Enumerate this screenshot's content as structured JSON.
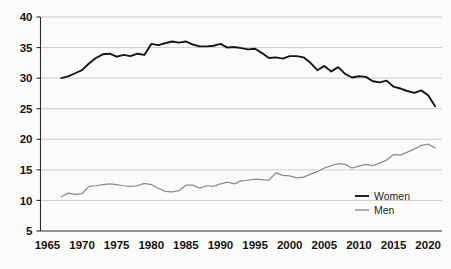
{
  "chart_data": {
    "type": "line",
    "title": "",
    "subtitle": "",
    "xlabel": "",
    "ylabel": "",
    "xlim": [
      1964,
      2022
    ],
    "ylim": [
      5,
      40
    ],
    "grid": true,
    "grid_axis": "y",
    "legend_position": "inside-bottom-right",
    "x_ticks": [
      1965,
      1970,
      1975,
      1980,
      1985,
      1990,
      1995,
      2000,
      2005,
      2010,
      2015,
      2020
    ],
    "y_ticks": [
      5,
      10,
      15,
      20,
      25,
      30,
      35,
      40
    ],
    "colors": {
      "women": "#151515",
      "men": "#8b8b8b",
      "gridline": "#b9b9b9",
      "axis": "#2b2b2b",
      "background": "#fbfbf9"
    },
    "x": [
      1967,
      1968,
      1969,
      1970,
      1971,
      1972,
      1973,
      1974,
      1975,
      1976,
      1977,
      1978,
      1979,
      1980,
      1981,
      1982,
      1983,
      1984,
      1985,
      1986,
      1987,
      1988,
      1989,
      1990,
      1991,
      1992,
      1993,
      1994,
      1995,
      1996,
      1997,
      1998,
      1999,
      2000,
      2001,
      2002,
      2003,
      2004,
      2005,
      2006,
      2007,
      2008,
      2009,
      2010,
      2011,
      2012,
      2013,
      2014,
      2015,
      2016,
      2017,
      2018,
      2019,
      2020,
      2021
    ],
    "series": [
      {
        "name": "Women",
        "color": "#151515",
        "values": [
          30.0,
          30.3,
          30.8,
          31.3,
          32.4,
          33.3,
          33.9,
          34.0,
          33.5,
          33.8,
          33.6,
          34.0,
          33.8,
          35.6,
          35.4,
          35.7,
          36.0,
          35.8,
          36.0,
          35.5,
          35.2,
          35.2,
          35.3,
          35.6,
          35.0,
          35.1,
          34.9,
          34.7,
          34.8,
          34.1,
          33.3,
          33.4,
          33.2,
          33.6,
          33.6,
          33.4,
          32.5,
          31.3,
          32.0,
          31.1,
          31.8,
          30.7,
          30.1,
          30.3,
          30.2,
          29.5,
          29.3,
          29.6,
          28.6,
          28.3,
          27.9,
          27.6,
          28.0,
          27.2,
          25.4
        ]
      },
      {
        "name": "Men",
        "color": "#8b8b8b",
        "values": [
          10.6,
          11.2,
          11.0,
          11.1,
          12.3,
          12.4,
          12.6,
          12.7,
          12.6,
          12.4,
          12.3,
          12.4,
          12.8,
          12.6,
          12.0,
          11.5,
          11.4,
          11.6,
          12.5,
          12.5,
          12.0,
          12.4,
          12.3,
          12.7,
          13.0,
          12.7,
          13.2,
          13.3,
          13.5,
          13.4,
          13.3,
          14.5,
          14.1,
          14.0,
          13.7,
          13.8,
          14.3,
          14.7,
          15.3,
          15.7,
          16.0,
          15.9,
          15.3,
          15.6,
          15.9,
          15.7,
          16.1,
          16.6,
          17.5,
          17.4,
          17.9,
          18.4,
          19.0,
          19.2,
          18.6
        ]
      }
    ],
    "legend": [
      {
        "label": "Women",
        "color": "#151515"
      },
      {
        "label": "Men",
        "color": "#8b8b8b"
      }
    ]
  }
}
